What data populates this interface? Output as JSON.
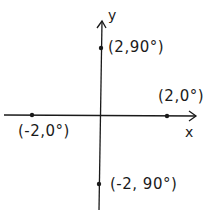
{
  "diagram": {
    "type": "polar-coordinate-points-on-cartesian-axes",
    "axes": {
      "x_label": "x",
      "y_label": "y"
    },
    "points": [
      {
        "label": "(2,90°)",
        "r": 2,
        "theta_deg": 90,
        "px": 101,
        "py": 48
      },
      {
        "label": "(2,0°)",
        "r": 2,
        "theta_deg": 0,
        "px": 167,
        "py": 115
      },
      {
        "label": "(-2,0°)",
        "r": -2,
        "theta_deg": 0,
        "px": 32,
        "py": 115
      },
      {
        "label": "(-2, 90°)",
        "r": -2,
        "theta_deg": 90,
        "px": 99,
        "py": 184
      }
    ],
    "colors": {
      "ink": "#1a1a1a",
      "background": "#ffffff"
    }
  }
}
